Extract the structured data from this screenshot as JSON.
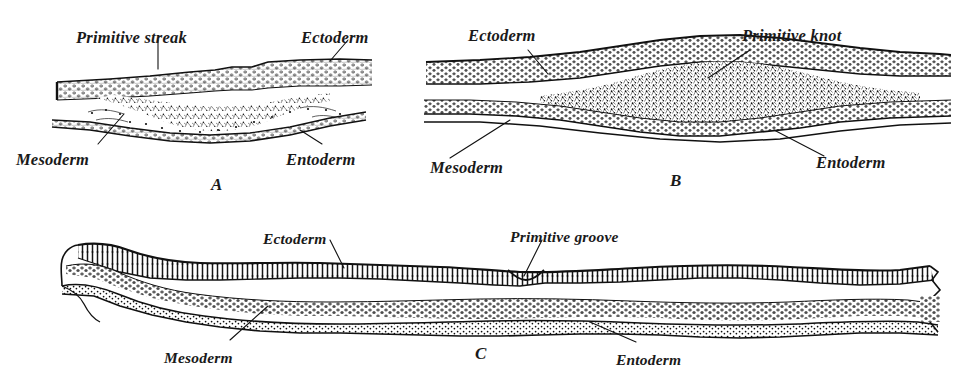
{
  "figure": {
    "kind": "histology-plate",
    "background": "#ffffff",
    "ink": "#111111",
    "panels": [
      {
        "id": "A",
        "letter": "A",
        "letter_pos": {
          "x": 211,
          "y": 176
        },
        "labels": [
          {
            "name": "primitive-streak",
            "text": "Primitive streak",
            "x": 76,
            "y": 30
          },
          {
            "name": "ectoderm",
            "text": "Ectoderm",
            "x": 301,
            "y": 30
          },
          {
            "name": "mesoderm",
            "text": "Mesoderm",
            "x": 16,
            "y": 152
          },
          {
            "name": "entoderm",
            "text": "Entoderm",
            "x": 286,
            "y": 152
          }
        ]
      },
      {
        "id": "B",
        "letter": "B",
        "letter_pos": {
          "x": 670,
          "y": 172
        },
        "labels": [
          {
            "name": "ectoderm",
            "text": "Ectoderm",
            "x": 468,
            "y": 28
          },
          {
            "name": "primitive-knot",
            "text": "Primitive knot",
            "x": 742,
            "y": 28
          },
          {
            "name": "mesoderm",
            "text": "Mesoderm",
            "x": 430,
            "y": 160
          },
          {
            "name": "entoderm",
            "text": "Entoderm",
            "x": 816,
            "y": 155
          }
        ]
      },
      {
        "id": "C",
        "letter": "C",
        "letter_pos": {
          "x": 475,
          "y": 345
        },
        "labels": [
          {
            "name": "ectoderm",
            "text": "Ectoderm",
            "x": 263,
            "y": 231
          },
          {
            "name": "primitive-groove",
            "text": "Primitive groove",
            "x": 510,
            "y": 229
          },
          {
            "name": "mesoderm",
            "text": "Mesoderm",
            "x": 164,
            "y": 350
          },
          {
            "name": "entoderm",
            "text": "Entoderm",
            "x": 616,
            "y": 352
          }
        ]
      }
    ],
    "legend_terms": [
      "Ectoderm",
      "Mesoderm",
      "Entoderm",
      "Primitive streak",
      "Primitive knot",
      "Primitive groove"
    ]
  }
}
